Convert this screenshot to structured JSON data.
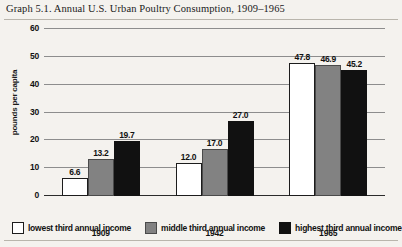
{
  "chart_data": {
    "type": "bar",
    "title": "Graph 5.1. Annual U.S. Urban Poultry Consumption, 1909–1965",
    "xlabel": "",
    "ylabel": "pounds per capita",
    "ylim": [
      0,
      60
    ],
    "yticks": [
      0,
      10,
      20,
      30,
      40,
      50,
      60
    ],
    "grid": true,
    "legend_position": "bottom",
    "categories": [
      "1909",
      "1942",
      "1965"
    ],
    "series": [
      {
        "name": "lowest third annual income",
        "color": "#ffffff",
        "values": [
          6.6,
          12.0,
          47.8
        ],
        "labels": [
          "6.6",
          "12.0",
          "47.8"
        ]
      },
      {
        "name": "middle third annual income",
        "color": "#828282",
        "values": [
          13.2,
          17.0,
          46.9
        ],
        "labels": [
          "13.2",
          "17.0",
          "46.9"
        ]
      },
      {
        "name": "highest third annual income",
        "color": "#111111",
        "values": [
          19.7,
          27.0,
          45.2
        ],
        "labels": [
          "19.7",
          "27.0",
          "45.2"
        ]
      }
    ]
  }
}
